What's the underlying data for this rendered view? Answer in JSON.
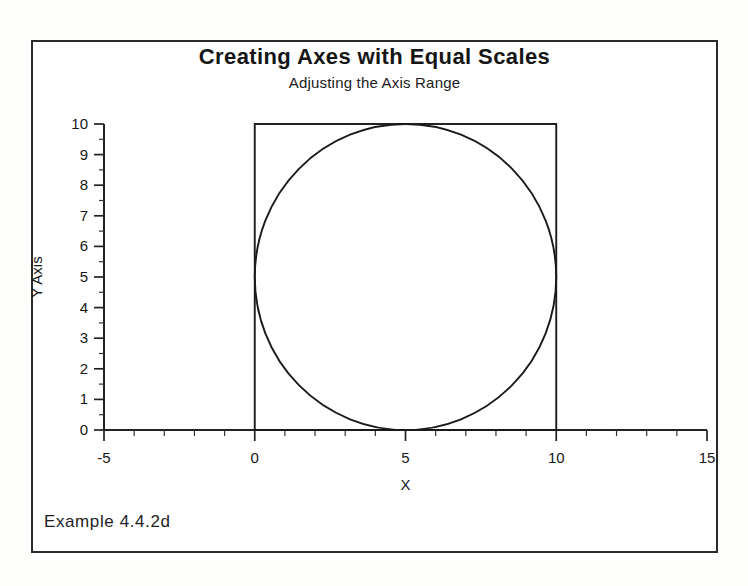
{
  "figure": {
    "caption": "Example 4.4.2d"
  },
  "chart_data": {
    "type": "line",
    "title": "Creating Axes with Equal Scales",
    "subtitle": "Adjusting the Axis Range",
    "xlabel": "X",
    "ylabel": "Y Axis",
    "xlim": [
      -5,
      15
    ],
    "ylim": [
      0,
      10
    ],
    "grid": false,
    "legend": "none",
    "equal_aspect": true,
    "xticks": [
      -5,
      0,
      5,
      10,
      15
    ],
    "xtick_labels": [
      "-5",
      "0",
      "5",
      "10",
      "15"
    ],
    "xminor_step": 1,
    "yticks": [
      0,
      1,
      2,
      3,
      4,
      5,
      6,
      7,
      8,
      9,
      10
    ],
    "ytick_labels": [
      "0",
      "1",
      "2",
      "3",
      "4",
      "5",
      "6",
      "7",
      "8",
      "9",
      "10"
    ],
    "yminor_step": 0.5,
    "series": [
      {
        "name": "square",
        "shape": "rectangle",
        "x": [
          0,
          10,
          10,
          0,
          0
        ],
        "y": [
          0,
          0,
          10,
          10,
          0
        ],
        "x0": 0,
        "y0": 0,
        "width": 10,
        "height": 10,
        "color": "#1a1a1a"
      },
      {
        "name": "circle",
        "shape": "circle",
        "center_x": 5,
        "center_y": 5,
        "radius": 5,
        "color": "#1a1a1a"
      }
    ],
    "annotations": []
  }
}
